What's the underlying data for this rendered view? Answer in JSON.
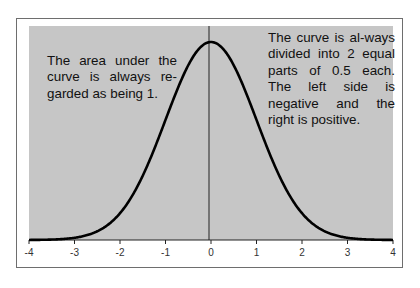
{
  "chart_data": {
    "type": "line",
    "title": "",
    "xlabel": "",
    "ylabel": "",
    "xlim": [
      -4,
      4
    ],
    "x_ticks": [
      -4,
      -3,
      -2,
      -1,
      0,
      1,
      2,
      3,
      4
    ],
    "x_tick_labels": [
      "-4",
      "-3",
      "-2",
      "-1",
      "0",
      "1",
      "2",
      "3",
      "4"
    ],
    "grid": false,
    "legend": null,
    "series": [
      {
        "name": "standard normal density",
        "function": "exp(-x^2/2)/sqrt(2*pi)",
        "x_range": [
          -4,
          4
        ]
      }
    ],
    "vertical_line_x": 0,
    "annotations": [
      "The area under the curve is always re-garded as being 1.",
      "The curve is al-ways divided into 2 equal parts of 0.5 each. The left side is negative and the right is positive."
    ],
    "colors": {
      "plot_background": "#c6c6c6",
      "curve": "#000000",
      "frame": "#6e6e6e"
    }
  },
  "notes": {
    "left": "The area under the curve is always re-garded as being 1.",
    "right": "The curve is al-ways divided into 2 equal parts of 0.5 each. The left side is negative and the right is positive."
  },
  "axis": {
    "ticks": [
      {
        "label": "-4"
      },
      {
        "label": "-3"
      },
      {
        "label": "-2"
      },
      {
        "label": "-1"
      },
      {
        "label": "0"
      },
      {
        "label": "1"
      },
      {
        "label": "2"
      },
      {
        "label": "3"
      },
      {
        "label": "4"
      }
    ]
  }
}
